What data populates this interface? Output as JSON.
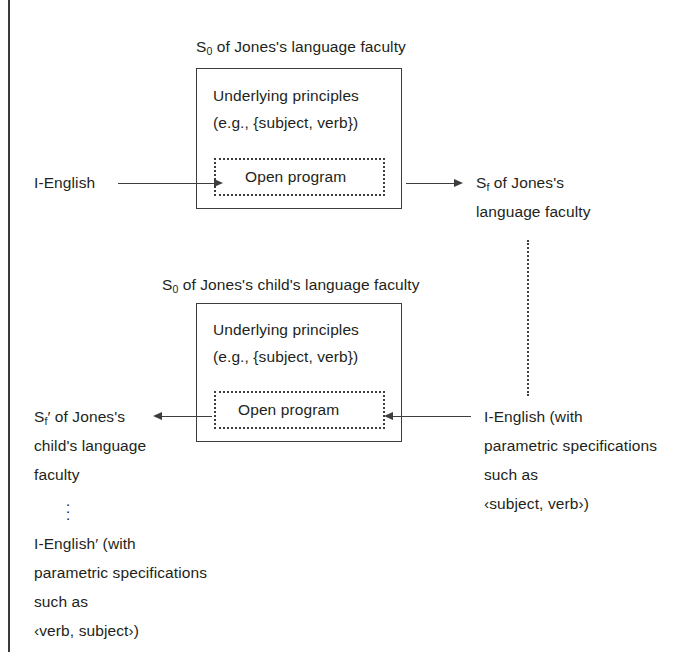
{
  "figure": {
    "title_top_box": {
      "prefix": "S",
      "sub": "0",
      "rest": " of Jones's language faculty"
    },
    "title_bottom_box": {
      "prefix": "S",
      "sub": "0",
      "rest": " of Jones's child's language faculty"
    },
    "box_top": {
      "line1": "Underlying principles",
      "line2": "(e.g., {subject, verb})",
      "inner_label": "Open program"
    },
    "box_bottom": {
      "line1": "Underlying principles",
      "line2": "(e.g., {subject, verb})",
      "inner_label": "Open program"
    },
    "input_left_top": "I-English",
    "output_right_top": {
      "prefix": "S",
      "sub": "f",
      "rest": " of Jones's",
      "line2": "language faculty"
    },
    "output_left_bottom": {
      "prefix": "S",
      "sub": "f",
      "prime": "′",
      "rest": " of Jones's",
      "line2": "child's language",
      "line3": "faculty"
    },
    "input_right_bottom": {
      "line1": "I-English (with",
      "line2": "parametric specifications",
      "line3": "such as",
      "line4": "‹subject, verb›)"
    },
    "derived_bottom_left": {
      "line1": "I-English′ (with",
      "line2": "parametric specifications",
      "line3": "such as",
      "line4": "‹verb, subject›)"
    },
    "ellipsis_dot": "·",
    "colors": {
      "ink": "#231f20",
      "rule": "#3d3d3d",
      "background": "#ffffff"
    }
  }
}
